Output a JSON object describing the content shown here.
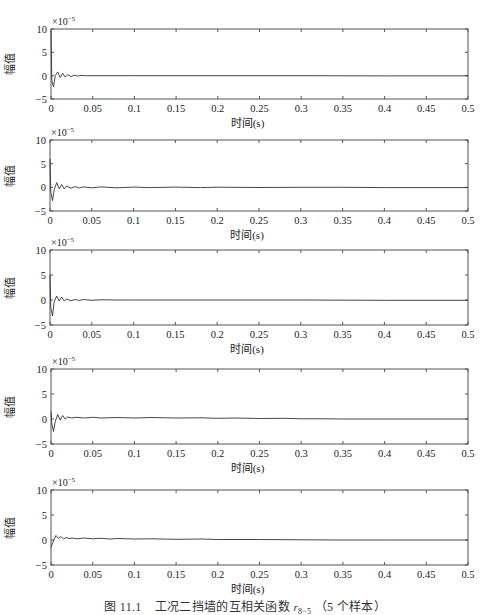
{
  "figure": {
    "caption_prefix": "图 11.1",
    "caption_text": "工况二挡墙的互相关函数",
    "caption_var": "r",
    "caption_sub": "8−5",
    "caption_suffix": "（5 个样本）"
  },
  "chart_data": {
    "type": "line",
    "layout": "5 vertically stacked subplots",
    "grid": false,
    "legend": null,
    "colors": {
      "axis": "#555555",
      "line": "#333333",
      "background": "#ffffff"
    },
    "subplots": [
      {
        "id": 1,
        "ylabel": "幅值",
        "xlabel": "时间(s)",
        "exponent_label": "×10",
        "exponent": "-5",
        "xlim": [
          0,
          0.5
        ],
        "ylim": [
          -5,
          10
        ],
        "xticks": [
          "0",
          "0.05",
          "0.1",
          "0.15",
          "0.2",
          "0.25",
          "0.3",
          "0.35",
          "0.4",
          "0.45",
          "0.5"
        ],
        "yticks": [
          "-5",
          "0",
          "5",
          "10"
        ],
        "box": {
          "left": 51,
          "top": 29,
          "right": 468,
          "bottom": 99
        },
        "x": [
          0,
          0.001,
          0.003,
          0.005,
          0.008,
          0.011,
          0.014,
          0.017,
          0.02,
          0.024,
          0.028,
          0.032,
          0.036,
          0.04,
          0.06,
          0.1,
          0.2,
          0.3,
          0.4,
          0.5
        ],
        "y": [
          9.5,
          -1.0,
          -2.4,
          0.0,
          0.8,
          -0.4,
          0.5,
          -0.3,
          0.2,
          -0.2,
          0.1,
          -0.1,
          0.05,
          0,
          0,
          0,
          0,
          0,
          -0.05,
          -0.05
        ]
      },
      {
        "id": 2,
        "ylabel": "幅值",
        "xlabel": "时间(s)",
        "exponent_label": "×10",
        "exponent": "-5",
        "xlim": [
          0,
          0.5
        ],
        "ylim": [
          -5,
          10
        ],
        "xticks": [
          "0",
          "0.05",
          "0.1",
          "0.15",
          "0.2",
          "0.25",
          "0.3",
          "0.35",
          "0.4",
          "0.45",
          "0.5"
        ],
        "yticks": [
          "-5",
          "0",
          "5",
          "10"
        ],
        "box": {
          "left": 50,
          "top": 140,
          "right": 468,
          "bottom": 211
        },
        "x": [
          0,
          0.001,
          0.003,
          0.005,
          0.008,
          0.011,
          0.014,
          0.017,
          0.02,
          0.025,
          0.03,
          0.035,
          0.04,
          0.05,
          0.06,
          0.08,
          0.1,
          0.12,
          0.15,
          0.18,
          0.2,
          0.25,
          0.3,
          0.35,
          0.4,
          0.5
        ],
        "y": [
          6.0,
          -1.0,
          -2.8,
          -0.5,
          1.0,
          -0.3,
          0.6,
          -0.3,
          0.3,
          -0.2,
          0.15,
          -0.15,
          0.1,
          -0.1,
          0.1,
          -0.1,
          0.05,
          -0.05,
          0.05,
          -0.05,
          0.03,
          -0.03,
          0,
          0,
          -0.05,
          -0.05
        ]
      },
      {
        "id": 3,
        "ylabel": "幅值",
        "xlabel": "时间(s)",
        "exponent_label": "×10",
        "exponent": "-5",
        "xlim": [
          0,
          0.5
        ],
        "ylim": [
          -5,
          10
        ],
        "xticks": [
          "0",
          "0.05",
          "0.1",
          "0.15",
          "0.2",
          "0.25",
          "0.3",
          "0.35",
          "0.4",
          "0.45",
          "0.5"
        ],
        "yticks": [
          "-5",
          "0",
          "5",
          "10"
        ],
        "box": {
          "left": 50,
          "top": 250,
          "right": 468,
          "bottom": 325
        },
        "x": [
          0,
          0.001,
          0.003,
          0.005,
          0.008,
          0.011,
          0.014,
          0.017,
          0.02,
          0.025,
          0.03,
          0.035,
          0.04,
          0.05,
          0.06,
          0.08,
          0.1,
          0.2,
          0.3,
          0.4,
          0.5
        ],
        "y": [
          5.0,
          -1.5,
          -3.2,
          -0.3,
          0.8,
          -0.2,
          0.6,
          -0.2,
          0.2,
          -0.15,
          0.1,
          -0.1,
          0.1,
          -0.05,
          0.05,
          0,
          0,
          0,
          0,
          -0.05,
          -0.05
        ]
      },
      {
        "id": 4,
        "ylabel": "幅值",
        "xlabel": "时间(s)",
        "exponent_label": "×10",
        "exponent": "-5",
        "xlim": [
          0,
          0.5
        ],
        "ylim": [
          -5,
          10
        ],
        "xticks": [
          "0",
          "0.05",
          "0.1",
          "0.15",
          "0.2",
          "0.25",
          "0.3",
          "0.35",
          "0.4",
          "0.45",
          "0.5"
        ],
        "yticks": [
          "-5",
          "0",
          "5",
          "10"
        ],
        "box": {
          "left": 51,
          "top": 369,
          "right": 468,
          "bottom": 444
        },
        "x": [
          0,
          0.001,
          0.003,
          0.005,
          0.008,
          0.011,
          0.014,
          0.017,
          0.02,
          0.025,
          0.03,
          0.04,
          0.05,
          0.06,
          0.08,
          0.1,
          0.12,
          0.15,
          0.18,
          0.2,
          0.22,
          0.25,
          0.28,
          0.3,
          0.33,
          0.35,
          0.4,
          0.5
        ],
        "y": [
          1.5,
          -1.0,
          -2.5,
          -0.5,
          0.9,
          -0.2,
          0.7,
          0.0,
          0.4,
          0.2,
          0.35,
          0.2,
          0.35,
          0.2,
          0.3,
          0.2,
          0.3,
          0.2,
          0.25,
          0.15,
          0.2,
          0.1,
          0.15,
          0.05,
          0.05,
          0,
          0,
          0
        ]
      },
      {
        "id": 5,
        "ylabel": "幅值",
        "xlabel": "时间(s)",
        "exponent_label": "×10",
        "exponent": "-5",
        "xlim": [
          0,
          0.5
        ],
        "ylim": [
          -5,
          10
        ],
        "xticks": [
          "0",
          "0.05",
          "0.1",
          "0.15",
          "0.2",
          "0.25",
          "0.3",
          "0.35",
          "0.4",
          "0.45",
          "0.5"
        ],
        "yticks": [
          "-5",
          "0",
          "5",
          "10"
        ],
        "box": {
          "left": 51,
          "top": 490,
          "right": 468,
          "bottom": 565
        },
        "x": [
          0,
          0.002,
          0.004,
          0.006,
          0.009,
          0.012,
          0.015,
          0.018,
          0.022,
          0.026,
          0.03,
          0.04,
          0.05,
          0.06,
          0.07,
          0.08,
          0.1,
          0.12,
          0.15,
          0.18,
          0.2,
          0.25,
          0.3,
          0.35,
          0.4,
          0.5
        ],
        "y": [
          -1.5,
          -0.5,
          0.2,
          0.9,
          0.3,
          0.7,
          0.2,
          0.5,
          0.3,
          0.4,
          0.25,
          0.4,
          0.25,
          0.35,
          0.2,
          0.3,
          0.2,
          0.25,
          0.15,
          0.2,
          0.1,
          0.1,
          0.05,
          0,
          0,
          0
        ]
      }
    ]
  }
}
